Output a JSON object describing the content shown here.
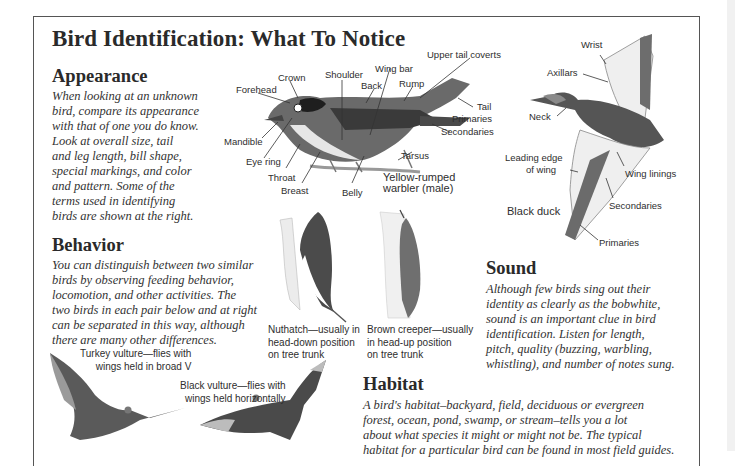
{
  "page": {
    "title": "Bird Identification: What To Notice"
  },
  "appearance": {
    "heading": "Appearance",
    "body_lines": [
      "When looking at an unknown",
      "bird, compare its appearance",
      "with that of one you do know.",
      "Look at overall size, tail",
      "and leg length, bill shape,",
      "special markings, and color",
      "and pattern. Some of the",
      "terms used in identifying",
      "birds are shown at the right."
    ]
  },
  "warbler": {
    "caption_lines": [
      "Yellow-rumped",
      "warbler (male)"
    ],
    "labels": {
      "forehead": "Forehead",
      "crown": "Crown",
      "shoulder": "Shoulder",
      "wing_bar": "Wing bar",
      "back": "Back",
      "rump": "Rump",
      "upper_tail_coverts": "Upper tail coverts",
      "tail": "Tail",
      "primaries": "Primaries",
      "secondaries": "Secondaries",
      "mandible": "Mandible",
      "eye_ring": "Eye ring",
      "throat": "Throat",
      "breast": "Breast",
      "belly": "Belly",
      "tarsus": "Tarsus"
    }
  },
  "duck": {
    "caption": "Black duck",
    "labels": {
      "wrist": "Wrist",
      "axillars": "Axillars",
      "neck": "Neck",
      "leading_edge_1": "Leading edge",
      "leading_edge_2": "of wing",
      "wing_linings": "Wing linings",
      "secondaries": "Secondaries",
      "primaries": "Primaries"
    }
  },
  "behavior": {
    "heading": "Behavior",
    "body_lines": [
      "You can distinguish between two similar",
      "birds by observing feeding behavior,",
      "locomotion, and other activities. The",
      "two birds in each pair below and at right",
      "can be separated in this way, although",
      "there are many other differences."
    ],
    "nuthatch_caption": [
      "Nuthatch—usually in",
      "head-down position",
      "on tree trunk"
    ],
    "creeper_caption": [
      "Brown creeper—usually",
      "in head-up position",
      "on tree trunk"
    ],
    "turkey_vulture_caption": [
      "Turkey vulture—flies with",
      "wings held in broad V"
    ],
    "black_vulture_caption": [
      "Black vulture—flies with",
      "wings held horizontally"
    ]
  },
  "sound": {
    "heading": "Sound",
    "body_lines": [
      "Although few birds sing out their",
      "identity as clearly as the bobwhite,",
      "sound is an important clue in bird",
      "identification. Listen for length,",
      "pitch, quality (buzzing, warbling,",
      "whistling), and number of notes sung."
    ]
  },
  "habitat": {
    "heading": "Habitat",
    "body_lines": [
      "A bird's habitat–backyard, field, deciduous or evergreen",
      "forest, ocean, pond, swamp, or stream–tells you a lot",
      "about what species it might or might not be. The typical",
      "habitat for a particular bird can be found in most field guides."
    ]
  }
}
